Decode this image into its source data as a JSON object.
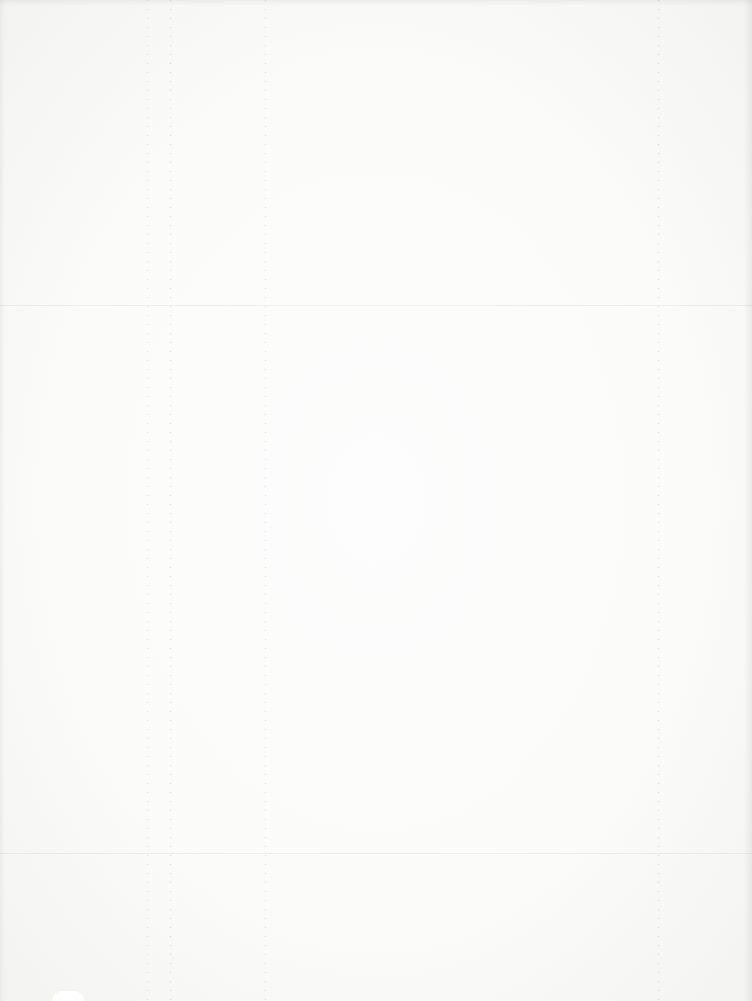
{
  "document": {
    "type": "blank-scanned-page",
    "background_color": "#f9f9f8",
    "text_content": "",
    "fold_lines_y": [
      305,
      853
    ],
    "bleed_through_lines_x": [
      147,
      170,
      265,
      658
    ]
  }
}
